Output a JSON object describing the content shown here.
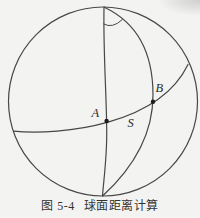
{
  "theme": {
    "bg": "#f3f3f1",
    "line": "#474747",
    "label": "#2b2b2b",
    "caption-color": "#333333"
  },
  "figure": {
    "points": {
      "a": "A",
      "b": "B"
    },
    "arc_label": "S",
    "caption": {
      "number": "图 5-4",
      "title": "球面距离计算"
    }
  }
}
